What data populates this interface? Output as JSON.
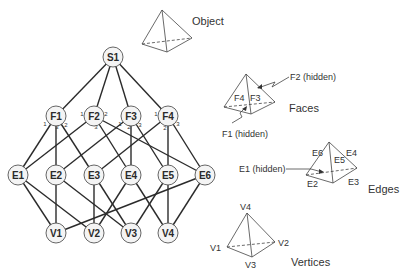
{
  "graph": {
    "nodes": [
      {
        "id": "S1",
        "label": "S1",
        "level": "shell",
        "x": 113,
        "y": 57
      },
      {
        "id": "F1",
        "label": "F1",
        "level": "face",
        "x": 56,
        "y": 116
      },
      {
        "id": "F2",
        "label": "F2",
        "level": "face",
        "x": 94,
        "y": 116
      },
      {
        "id": "F3",
        "label": "F3",
        "level": "face",
        "x": 131,
        "y": 116
      },
      {
        "id": "F4",
        "label": "F4",
        "level": "face",
        "x": 168,
        "y": 116
      },
      {
        "id": "E1",
        "label": "E1",
        "level": "edge",
        "x": 18,
        "y": 175
      },
      {
        "id": "E2",
        "label": "E2",
        "level": "edge",
        "x": 56,
        "y": 175
      },
      {
        "id": "E3",
        "label": "E3",
        "level": "edge",
        "x": 94,
        "y": 175
      },
      {
        "id": "E4",
        "label": "E4",
        "level": "edge",
        "x": 131,
        "y": 175
      },
      {
        "id": "E5",
        "label": "E5",
        "level": "edge",
        "x": 168,
        "y": 175
      },
      {
        "id": "E6",
        "label": "E6",
        "level": "edge",
        "x": 205,
        "y": 175
      },
      {
        "id": "V1",
        "label": "V1",
        "level": "vertex",
        "x": 56,
        "y": 233
      },
      {
        "id": "V2",
        "label": "V2",
        "level": "vertex",
        "x": 94,
        "y": 233
      },
      {
        "id": "V3",
        "label": "V3",
        "level": "vertex",
        "x": 131,
        "y": 233
      },
      {
        "id": "V4",
        "label": "V4",
        "level": "vertex",
        "x": 168,
        "y": 233
      }
    ],
    "edges": [
      {
        "from": "S1",
        "to": "F1"
      },
      {
        "from": "S1",
        "to": "F2"
      },
      {
        "from": "S1",
        "to": "F3"
      },
      {
        "from": "S1",
        "to": "F4"
      },
      {
        "from": "F1",
        "to": "E1",
        "port": "1"
      },
      {
        "from": "F1",
        "to": "E2",
        "port": "3"
      },
      {
        "from": "F1",
        "to": "E3",
        "port": "2"
      },
      {
        "from": "F2",
        "to": "E1",
        "port": "1"
      },
      {
        "from": "F2",
        "to": "E4",
        "port": "3"
      },
      {
        "from": "F2",
        "to": "E6",
        "port": "2"
      },
      {
        "from": "F3",
        "to": "E2",
        "port": "1"
      },
      {
        "from": "F3",
        "to": "E4",
        "port": "2"
      },
      {
        "from": "F3",
        "to": "E5",
        "port": "3"
      },
      {
        "from": "F4",
        "to": "E3",
        "port": "1"
      },
      {
        "from": "F4",
        "to": "E5",
        "port": "2"
      },
      {
        "from": "F4",
        "to": "E6",
        "port": "3"
      },
      {
        "from": "E1",
        "to": "V1"
      },
      {
        "from": "E1",
        "to": "V2"
      },
      {
        "from": "E2",
        "to": "V1"
      },
      {
        "from": "E2",
        "to": "V3"
      },
      {
        "from": "E3",
        "to": "V2"
      },
      {
        "from": "E3",
        "to": "V3"
      },
      {
        "from": "E4",
        "to": "V2"
      },
      {
        "from": "E4",
        "to": "V4"
      },
      {
        "from": "E5",
        "to": "V3"
      },
      {
        "from": "E5",
        "to": "V4"
      },
      {
        "from": "E6",
        "to": "V1"
      },
      {
        "from": "E6",
        "to": "V4"
      }
    ],
    "ports": [
      {
        "label": "1",
        "x": 45,
        "y": 124
      },
      {
        "label": "3",
        "x": 57,
        "y": 127
      },
      {
        "label": "2",
        "x": 66,
        "y": 125
      },
      {
        "label": "1",
        "x": 82,
        "y": 114
      },
      {
        "label": "2",
        "x": 106,
        "y": 114
      },
      {
        "label": "3",
        "x": 96,
        "y": 127
      },
      {
        "label": "1",
        "x": 120,
        "y": 124
      },
      {
        "label": "2",
        "x": 129,
        "y": 127
      },
      {
        "label": "3",
        "x": 140,
        "y": 125
      },
      {
        "label": "1",
        "x": 156,
        "y": 114
      },
      {
        "label": "2",
        "x": 165,
        "y": 128
      },
      {
        "label": "3",
        "x": 178,
        "y": 124
      }
    ]
  },
  "panels": {
    "object": {
      "title": "Object"
    },
    "faces": {
      "title": "Faces",
      "labels": [
        "F4",
        "F3"
      ],
      "hidden_top": "F2 (hidden)",
      "hidden_bottom": "F1 (hidden)"
    },
    "edges": {
      "title": "Edges",
      "labels": [
        "E6",
        "E5",
        "E4",
        "E2",
        "E3"
      ],
      "hidden": "E1 (hidden)"
    },
    "vertices": {
      "title": "Vertices",
      "labels": [
        "V4",
        "V1",
        "V2",
        "V3"
      ]
    }
  },
  "colors": {
    "line": "#2b2b2b",
    "node_fill": "#f4f4f4",
    "node_stroke": "#555555",
    "text": "#333333"
  }
}
